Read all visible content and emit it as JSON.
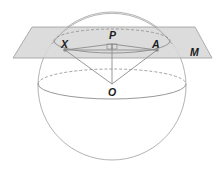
{
  "diagram": {
    "type": "geometry",
    "labels": {
      "plane": "M",
      "center_sphere": "O",
      "center_circle": "P",
      "point_left": "X",
      "point_right": "A"
    },
    "colors": {
      "plane_fill": "#d4d4d4",
      "plane_stroke": "#9a9a9a",
      "line": "#8c8c8c",
      "label": "#1a1a1a",
      "point": "#8a8a8a"
    },
    "annotations": {
      "right_angle_at": "P"
    }
  }
}
